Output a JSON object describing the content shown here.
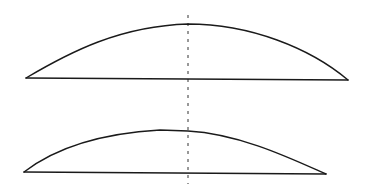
{
  "diagram": {
    "colors": {
      "line": "#1a1a1a",
      "axis": "#333333",
      "background": "#ffffff"
    },
    "axis": {
      "x": 188,
      "y1": 15,
      "y2": 184
    },
    "shapes": [
      {
        "name": "upper-segment",
        "chord": {
          "x1": 26,
          "y1": 78,
          "x2": 348,
          "y2": 80
        },
        "arc_path": "M26 78 C 70 52, 120 26, 188 24 C 250 24, 310 48, 348 80"
      },
      {
        "name": "lower-segment",
        "chord": {
          "x1": 24,
          "y1": 172,
          "x2": 326,
          "y2": 174
        },
        "arc_path": "M24 172 C 50 152, 90 134, 160 130 L 188 131 C 240 134, 290 158, 326 174"
      }
    ]
  }
}
